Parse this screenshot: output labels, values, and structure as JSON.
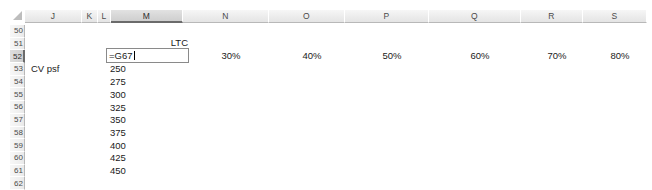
{
  "app": {
    "type": "spreadsheet",
    "gridlines_visible": false,
    "background_color": "#ffffff",
    "selection_accent_color": "#6b6b6b"
  },
  "select_all_corner": {
    "icon": "select-all-triangle-icon"
  },
  "columns": [
    {
      "label": "J",
      "left": 30,
      "width": 57,
      "selected": false
    },
    {
      "label": "K",
      "left": 87,
      "width": 16,
      "selected": false
    },
    {
      "label": "L",
      "left": 103,
      "width": 13,
      "selected": false
    },
    {
      "label": "M",
      "left": 116,
      "width": 72,
      "selected": true
    },
    {
      "label": "N",
      "left": 188,
      "width": 86,
      "selected": false
    },
    {
      "label": "O",
      "left": 274,
      "width": 76,
      "selected": false
    },
    {
      "label": "P",
      "left": 350,
      "width": 84,
      "selected": false
    },
    {
      "label": "Q",
      "left": 434,
      "width": 92,
      "selected": false
    },
    {
      "label": "R",
      "left": 526,
      "width": 62,
      "selected": false
    },
    {
      "label": "S",
      "left": 588,
      "width": 64,
      "selected": false
    }
  ],
  "rows": [
    {
      "label": "50",
      "selected": false
    },
    {
      "label": "51",
      "selected": false
    },
    {
      "label": "52",
      "selected": true
    },
    {
      "label": "53",
      "selected": false
    },
    {
      "label": "54",
      "selected": false
    },
    {
      "label": "55",
      "selected": false
    },
    {
      "label": "56",
      "selected": false
    },
    {
      "label": "57",
      "selected": false
    },
    {
      "label": "58",
      "selected": false
    },
    {
      "label": "59",
      "selected": false
    },
    {
      "label": "60",
      "selected": false
    },
    {
      "label": "61",
      "selected": false
    },
    {
      "label": "62",
      "selected": false
    }
  ],
  "active_cell": {
    "reference": "M52",
    "mode": "editing",
    "value": "=G67",
    "left": 106,
    "top": 48,
    "width": 83,
    "height": 15
  },
  "cells": [
    {
      "name": "cell-M51-ltc-label",
      "text": "LTC",
      "left": 118,
      "top": 37,
      "width": 70,
      "align": "right"
    },
    {
      "name": "cell-J53-cv-psf-label",
      "text": "CV psf",
      "left": 31,
      "top": 63,
      "width": 56,
      "align": "left"
    },
    {
      "name": "cell-M53-value",
      "text": "250",
      "left": 110,
      "top": 63,
      "width": 30,
      "align": "left"
    },
    {
      "name": "cell-M54-value",
      "text": "275",
      "left": 110,
      "top": 76,
      "width": 30,
      "align": "left"
    },
    {
      "name": "cell-M55-value",
      "text": "300",
      "left": 110,
      "top": 89,
      "width": 30,
      "align": "left"
    },
    {
      "name": "cell-M56-value",
      "text": "325",
      "left": 110,
      "top": 102,
      "width": 30,
      "align": "left"
    },
    {
      "name": "cell-M57-value",
      "text": "350",
      "left": 110,
      "top": 114,
      "width": 30,
      "align": "left"
    },
    {
      "name": "cell-M58-value",
      "text": "375",
      "left": 110,
      "top": 127,
      "width": 30,
      "align": "left"
    },
    {
      "name": "cell-M59-value",
      "text": "400",
      "left": 110,
      "top": 140,
      "width": 30,
      "align": "left"
    },
    {
      "name": "cell-M60-value",
      "text": "425",
      "left": 110,
      "top": 152,
      "width": 30,
      "align": "left"
    },
    {
      "name": "cell-M61-value",
      "text": "450",
      "left": 110,
      "top": 165,
      "width": 30,
      "align": "left"
    },
    {
      "name": "cell-N52-percent",
      "text": "30%",
      "left": 196,
      "top": 50,
      "width": 70,
      "align": "center"
    },
    {
      "name": "cell-O52-percent",
      "text": "40%",
      "left": 280,
      "top": 50,
      "width": 64,
      "align": "center"
    },
    {
      "name": "cell-P52-percent",
      "text": "50%",
      "left": 356,
      "top": 50,
      "width": 72,
      "align": "center"
    },
    {
      "name": "cell-Q52-percent",
      "text": "60%",
      "left": 440,
      "top": 50,
      "width": 80,
      "align": "center"
    },
    {
      "name": "cell-R52-percent",
      "text": "70%",
      "left": 530,
      "top": 50,
      "width": 54,
      "align": "center"
    },
    {
      "name": "cell-S52-percent",
      "text": "80%",
      "left": 592,
      "top": 50,
      "width": 56,
      "align": "center"
    }
  ]
}
